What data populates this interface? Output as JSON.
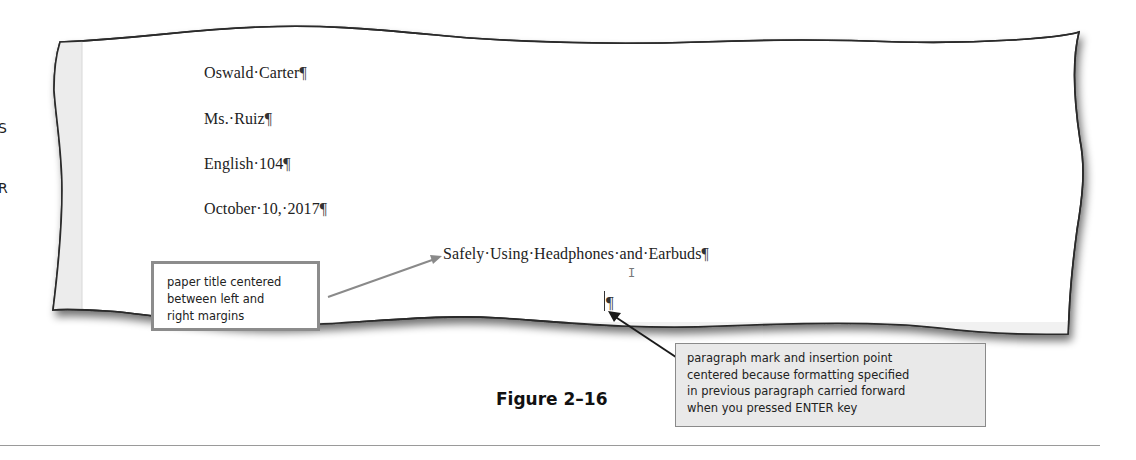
{
  "document": {
    "lines": [
      "Oswald·Carter",
      "Ms.·Ruiz",
      "English·104",
      "October·10,·2017"
    ],
    "title": "Safely·Using·Headphones·and·Earbuds",
    "paragraph_mark": "¶",
    "empty_paragraph_mark": "¶"
  },
  "edge_text": [
    "S",
    "R"
  ],
  "callouts": {
    "left": {
      "lines": [
        "paper title centered",
        "between left and",
        "right margins"
      ],
      "border_color": "#8c8c8c"
    },
    "right": {
      "lines": [
        "paragraph mark and insertion point",
        "centered because formatting specified",
        "in previous paragraph carried forward",
        "when you pressed ENTER key"
      ],
      "background": "#e9e9e9"
    }
  },
  "figure": {
    "caption": "Figure 2–16"
  },
  "icons": {
    "mouse_pointer": "ibeam-cursor"
  }
}
